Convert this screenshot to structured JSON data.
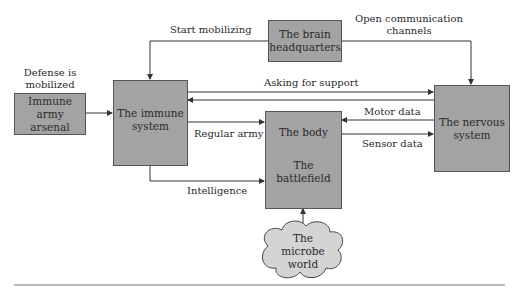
{
  "nodes": {
    "arsenal": {
      "line1": "Immune army",
      "line2": "arsenal"
    },
    "immune": {
      "line1": "The immune",
      "line2": "system"
    },
    "brain": {
      "line1": "The brain",
      "line2": "headquarters"
    },
    "body": {
      "line1": "The body",
      "line2": "The battlefield"
    },
    "nervous": {
      "line1": "The nervous",
      "line2": "system"
    },
    "microbe": {
      "line1": "The",
      "line2": "microbe",
      "line3": "world"
    }
  },
  "edges": {
    "defense": {
      "line1": "Defense is",
      "line2": "mobilized"
    },
    "start_mobilizing": "Start mobilizing",
    "open_comm": {
      "line1": "Open communication",
      "line2": "channels"
    },
    "asking_support": "Asking for support",
    "regular_army": "Regular army",
    "intelligence": "Intelligence",
    "motor_data": "Motor data",
    "sensor_data": "Sensor data"
  },
  "colors": {
    "box_fill": "#a3a3a3",
    "cloud_fill": "#d4d4d4",
    "line": "#333333"
  }
}
